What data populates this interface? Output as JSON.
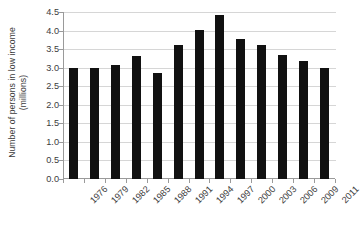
{
  "chart_data": {
    "type": "bar",
    "title": "",
    "subtitle": "",
    "xlabel": "",
    "ylabel": "Number of persons in low income (millions)",
    "ylabel_line1": "Number of persons in low income",
    "ylabel_line2": "(millions)",
    "categories": [
      "1976",
      "1979",
      "1982",
      "1985",
      "1988",
      "1991",
      "1994",
      "1997",
      "2000",
      "2003",
      "2006",
      "2009",
      "2011"
    ],
    "values": [
      3.0,
      3.0,
      3.07,
      3.32,
      2.87,
      3.62,
      4.02,
      4.42,
      3.78,
      3.62,
      3.34,
      3.17,
      3.0
    ],
    "series": [
      {
        "name": "Number of persons in low income",
        "values": [
          3.0,
          3.0,
          3.07,
          3.32,
          2.87,
          3.62,
          4.02,
          4.42,
          3.78,
          3.62,
          3.34,
          3.17,
          3.0
        ]
      }
    ],
    "ylim": [
      0.0,
      4.5
    ],
    "yticks": [
      0.0,
      0.5,
      1.0,
      1.5,
      2.0,
      2.5,
      3.0,
      3.5,
      4.0,
      4.5
    ],
    "ytick_labels": [
      "0.0",
      "0.5",
      "1.0",
      "1.5",
      "2.0",
      "2.5",
      "3.0",
      "3.5",
      "4.0",
      "4.5"
    ],
    "grid": "horizontal",
    "legend": "none",
    "bar_color": "#111111",
    "gridline_color": "#d6d6d6",
    "axis_color": "#9a9a9a",
    "background_color": "#ffffff",
    "xtick_label_rotation": "-45"
  }
}
